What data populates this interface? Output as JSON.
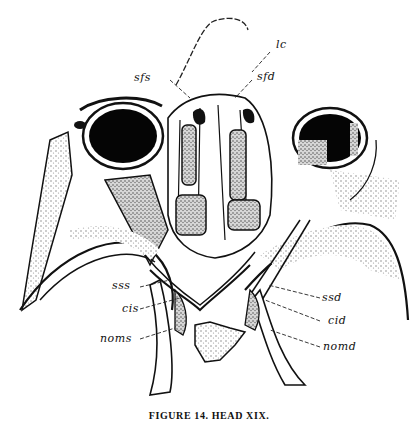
{
  "figure": {
    "caption": "FIGURE 14.   HEAD XIX.",
    "labels": {
      "lc": "lc",
      "sfs": "sfs",
      "sfd": "sfd",
      "sss": "sss",
      "cis": "cis",
      "noms": "noms",
      "ssd": "ssd",
      "cid": "cid",
      "nomd": "nomd"
    },
    "colors": {
      "ink": "#111111",
      "paper": "#ffffff",
      "stipple": "#9a9a9a"
    }
  }
}
